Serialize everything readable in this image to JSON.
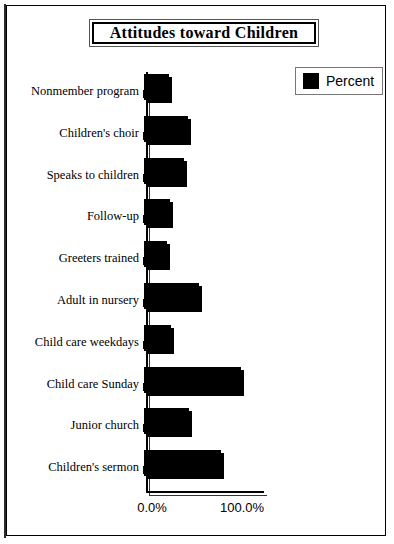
{
  "chart_data": {
    "type": "bar",
    "orientation": "horizontal",
    "title": "Attitudes toward Children",
    "xlabel": "",
    "ylabel": "",
    "xlim": [
      0,
      130
    ],
    "grid": false,
    "legend_position": "top-right",
    "axis_tick_labels": [
      "0.0%",
      "100.0%"
    ],
    "axis_tick_values": [
      0,
      100
    ],
    "legend": [
      {
        "name": "Percent",
        "color": "#000000"
      }
    ],
    "categories": [
      "Nonmember program",
      "Children's choir",
      "Speaks to children",
      "Follow-up",
      "Greeters trained",
      "Adult in nursery",
      "Child care weekdays",
      "Child care Sunday",
      "Junior church",
      "Children's sermon"
    ],
    "series": [
      {
        "name": "Percent",
        "values": [
          28,
          49,
          44,
          29,
          25,
          61,
          30,
          108,
          50,
          85
        ]
      }
    ]
  },
  "colors": {
    "bar": "#000000",
    "frame": "#000000",
    "background": "#ffffff"
  }
}
